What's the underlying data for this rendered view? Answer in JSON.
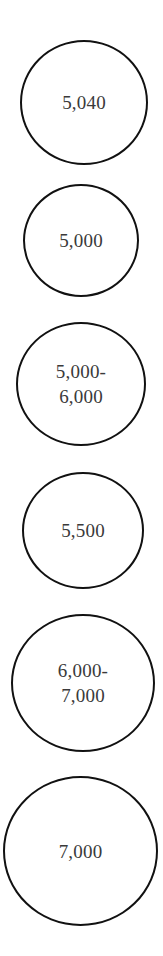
{
  "nodes": [
    {
      "label": "5,040"
    },
    {
      "label": "5,000"
    },
    {
      "label": "5,000-\n6,000"
    },
    {
      "label": "5,500"
    },
    {
      "label": "6,000-\n7,000"
    },
    {
      "label": "7,000"
    }
  ],
  "colors": {
    "stroke": "#111111",
    "text": "#3a3a3a",
    "background": "#ffffff"
  }
}
